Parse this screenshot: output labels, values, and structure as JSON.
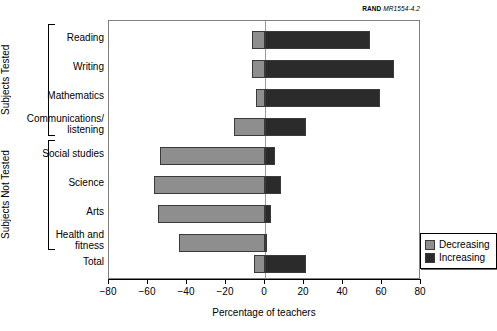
{
  "source_credit": {
    "mark": "RAND",
    "document": "MR1554-4.2"
  },
  "chart_data": {
    "type": "bar",
    "orientation": "horizontal",
    "stacked_diverging": true,
    "title": "",
    "xlabel": "Percentage of teachers",
    "ylabel": "",
    "xlim": [
      -80,
      80
    ],
    "xticks": [
      -80,
      -60,
      -40,
      -20,
      0,
      20,
      40,
      60,
      80
    ],
    "xticklabels": [
      "−80",
      "−60",
      "−40",
      "−20",
      "0",
      "20",
      "40",
      "60",
      "80"
    ],
    "grid": false,
    "legend_position": "inside-right",
    "categories": [
      "Reading",
      "Writing",
      "Mathematics",
      "Communications/\nlistening",
      "Social studies",
      "Science",
      "Arts",
      "Health and\nfitness",
      "Total"
    ],
    "series": [
      {
        "name": "Decreasing",
        "color": "#8e8e8e",
        "values": [
          -6.5,
          -6.5,
          -4.5,
          -16,
          -54,
          -57,
          -55,
          -44,
          -5.5
        ]
      },
      {
        "name": "Increasing",
        "color": "#2b2b2b",
        "values": [
          54,
          66,
          59,
          21,
          5,
          8,
          3,
          1,
          21
        ]
      }
    ],
    "groups": [
      {
        "label": "Subjects Tested",
        "categories": [
          "Reading",
          "Writing",
          "Mathematics",
          "Communications/listening"
        ]
      },
      {
        "label": "Subjects Not Tested",
        "categories": [
          "Social studies",
          "Science",
          "Arts",
          "Health and fitness"
        ]
      }
    ]
  },
  "legend": {
    "items": [
      {
        "label": "Decreasing",
        "color": "#8e8e8e"
      },
      {
        "label": "Increasing",
        "color": "#2b2b2b"
      }
    ]
  }
}
